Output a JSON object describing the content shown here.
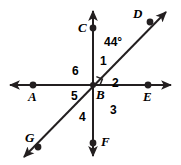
{
  "figure": {
    "type": "geometry-diagram",
    "width": 181,
    "height": 165,
    "background_color": "#ffffff",
    "stroke_color": "#231f20"
  },
  "points": [
    {
      "id": "A",
      "label": "A",
      "x": 33,
      "y": 85,
      "label_x": 28,
      "label_y": 90
    },
    {
      "id": "B",
      "label": "B",
      "x": 93,
      "y": 85,
      "label_x": 96,
      "label_y": 88
    },
    {
      "id": "C",
      "label": "C",
      "x": 93,
      "y": 28,
      "label_x": 78,
      "label_y": 22
    },
    {
      "id": "D",
      "label": "D",
      "x": 150,
      "y": 22,
      "label_x": 133,
      "label_y": 8
    },
    {
      "id": "E",
      "label": "E",
      "x": 148,
      "y": 85,
      "label_x": 143,
      "label_y": 90
    },
    {
      "id": "F",
      "label": "F",
      "x": 93,
      "y": 143,
      "label_x": 100,
      "label_y": 136
    },
    {
      "id": "G",
      "label": "G",
      "x": 38,
      "y": 147,
      "label_x": 26,
      "label_y": 132
    }
  ],
  "lines": [
    {
      "id": "horizontal",
      "name": "line-AE",
      "through": [
        "A",
        "B",
        "E"
      ],
      "x1": 6,
      "y1": 85,
      "x2": 175,
      "y2": 85,
      "arrows": "both"
    },
    {
      "id": "vertical",
      "name": "line-CF",
      "through": [
        "C",
        "B",
        "F"
      ],
      "x1": 93,
      "y1": 6,
      "x2": 93,
      "y2": 160,
      "arrows": "both"
    },
    {
      "id": "diagonal",
      "name": "line-GD",
      "through": [
        "G",
        "B",
        "D"
      ],
      "x1": 19,
      "y1": 162,
      "x2": 170,
      "y2": 8,
      "arrows": "both"
    }
  ],
  "angle_labels": [
    {
      "id": "1",
      "label": "1",
      "x": 100,
      "y": 55
    },
    {
      "id": "2",
      "label": "2",
      "x": 112,
      "y": 77
    },
    {
      "id": "3",
      "label": "3",
      "x": 110,
      "y": 104
    },
    {
      "id": "4",
      "label": "4",
      "x": 79,
      "y": 111
    },
    {
      "id": "5",
      "label": "5",
      "x": 71,
      "y": 90
    },
    {
      "id": "6",
      "label": "6",
      "x": 72,
      "y": 66
    }
  ],
  "angle_measures": [
    {
      "id": "dbc",
      "label": "44°",
      "x": 105,
      "y": 37
    }
  ],
  "right_angle_marker": {
    "label": "right-angle-square",
    "x": 93,
    "y": 85,
    "size": 9
  }
}
